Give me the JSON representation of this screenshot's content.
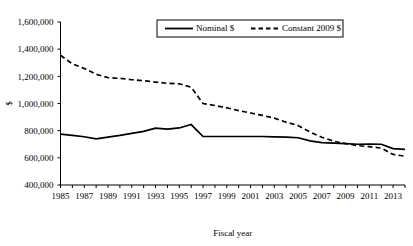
{
  "chart_data": {
    "type": "line",
    "title": "",
    "xlabel": "Fiscal year",
    "ylabel": "$",
    "ylim": [
      400000,
      1600000
    ],
    "xlim": [
      1985,
      2014
    ],
    "grid": false,
    "legend_position": "top-center",
    "y_ticks": [
      400000,
      600000,
      800000,
      1000000,
      1200000,
      1400000,
      1600000
    ],
    "y_tick_labels": [
      "400,000",
      "600,000",
      "800,000",
      "1,000,000",
      "1,200,000",
      "1,400,000",
      "1,600,000"
    ],
    "x": [
      1985,
      1986,
      1987,
      1988,
      1989,
      1990,
      1991,
      1992,
      1993,
      1994,
      1995,
      1996,
      1997,
      1998,
      1999,
      2000,
      2001,
      2002,
      2003,
      2004,
      2005,
      2006,
      2007,
      2008,
      2009,
      2010,
      2011,
      2012,
      2013,
      2014
    ],
    "x_tick_labels": [
      "1985",
      "1987",
      "1989",
      "1991",
      "1993",
      "1995",
      "1997",
      "1999",
      "2001",
      "2003",
      "2005",
      "2007",
      "2009",
      "2011",
      "2013"
    ],
    "x_tick_years": [
      1985,
      1987,
      1989,
      1991,
      1993,
      1995,
      1997,
      1999,
      2001,
      2003,
      2005,
      2007,
      2009,
      2011,
      2013
    ],
    "series": [
      {
        "name": "Nominal $",
        "style": "solid",
        "values": [
          775000,
          765000,
          755000,
          740000,
          752000,
          765000,
          780000,
          795000,
          818000,
          812000,
          820000,
          845000,
          757000,
          757000,
          757000,
          757000,
          757000,
          757000,
          755000,
          752000,
          748000,
          725000,
          712000,
          708000,
          705000,
          700000,
          702000,
          700000,
          668000,
          662000
        ]
      },
      {
        "name": "Constant 2009 $",
        "style": "dashed",
        "values": [
          1355000,
          1292000,
          1258000,
          1215000,
          1190000,
          1185000,
          1175000,
          1168000,
          1158000,
          1148000,
          1145000,
          1120000,
          1000000,
          985000,
          968000,
          948000,
          930000,
          912000,
          892000,
          862000,
          838000,
          790000,
          752000,
          722000,
          705000,
          690000,
          682000,
          672000,
          625000,
          612000
        ]
      }
    ]
  },
  "legend": {
    "items": [
      {
        "label": "Nominal $"
      },
      {
        "label": "Constant 2009 $"
      }
    ]
  }
}
